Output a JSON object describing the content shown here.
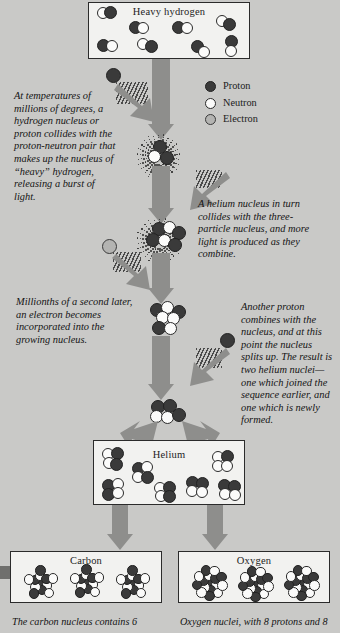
{
  "diagram": {
    "background_color": "#c9c9c7",
    "panel_color": "#f2f2f0",
    "arrow_color": "#8e8e8c"
  },
  "legend": {
    "items": [
      {
        "label": "Proton",
        "kind": "proton",
        "color": "#3a3a3a"
      },
      {
        "label": "Neutron",
        "kind": "neutron",
        "color": "#fbfbfa"
      },
      {
        "label": "Electron",
        "kind": "electron",
        "color": "#b4b4b2"
      }
    ]
  },
  "panels": {
    "heavy_hydrogen": {
      "title": "Heavy hydrogen",
      "nuclei_count": 8,
      "composition": "1 proton + 1 neutron (deuterium)"
    },
    "helium": {
      "title": "Helium",
      "nuclei_count": 7,
      "composition": "2 protons + 2 neutrons"
    },
    "carbon": {
      "title": "Carbon",
      "nuclei_count": 3,
      "composition": "6 protons and 6 neutrons"
    },
    "oxygen": {
      "title": "Oxygen",
      "nuclei_count": 3,
      "composition": "8 protons and 8 neutrons"
    }
  },
  "annotations": {
    "step1": "At temperatures of millions of degrees, a hydrogen nucleus or proton collides with the proton-neutron pair that makes up the nucleus of “heavy” hydrogen, releasing a burst of light.",
    "step2": "A helium nucleus in turn collides with the three-particle nucleus, and more light is produced as they combine.",
    "step3": "Millionths of a second later, an electron becomes incorporated into the growing nucleus.",
    "step4": "Another proton combines with the nucleus, and at this point the nucleus splits up. The result is two helium nuclei—one which joined the sequence earlier, and one which is newly formed."
  },
  "captions": {
    "carbon": "The carbon nucleus contains 6",
    "oxygen": "Oxygen nuclei, with 8 protons and 8"
  }
}
